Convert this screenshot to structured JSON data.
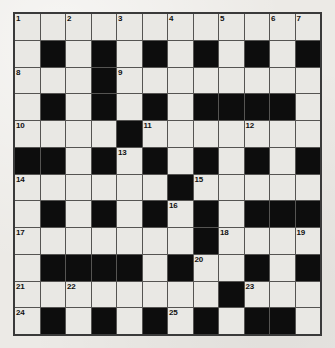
{
  "puzzle": {
    "title": "Crossword Grid",
    "rows": 12,
    "columns": 12,
    "colors": {
      "block": "#0d0d0d",
      "cell": "#e9e8e4",
      "grid_line": "#555452",
      "border": "#3a3a3a",
      "number_text": "#111111",
      "page_background": "#eceae6"
    },
    "numbers_total": 25,
    "grid": [
      [
        "open",
        "open",
        "open",
        "open",
        "open",
        "open",
        "open",
        "open",
        "open",
        "open",
        "open",
        "open"
      ],
      [
        "open",
        "block",
        "open",
        "block",
        "open",
        "block",
        "open",
        "block",
        "open",
        "block",
        "open",
        "block"
      ],
      [
        "open",
        "open",
        "open",
        "block",
        "open",
        "open",
        "open",
        "open",
        "open",
        "open",
        "open",
        "open"
      ],
      [
        "open",
        "block",
        "open",
        "block",
        "open",
        "block",
        "open",
        "block",
        "block",
        "block",
        "block",
        "open"
      ],
      [
        "open",
        "open",
        "open",
        "open",
        "block",
        "open",
        "open",
        "open",
        "open",
        "open",
        "open",
        "open"
      ],
      [
        "block",
        "block",
        "open",
        "block",
        "open",
        "block",
        "open",
        "block",
        "open",
        "block",
        "open",
        "block"
      ],
      [
        "open",
        "open",
        "open",
        "open",
        "open",
        "open",
        "block",
        "open",
        "open",
        "open",
        "open",
        "open"
      ],
      [
        "open",
        "block",
        "open",
        "block",
        "open",
        "block",
        "open",
        "block",
        "open",
        "block",
        "block",
        "block"
      ],
      [
        "open",
        "open",
        "open",
        "open",
        "open",
        "open",
        "open",
        "block",
        "open",
        "open",
        "open",
        "open"
      ],
      [
        "open",
        "block",
        "block",
        "block",
        "block",
        "open",
        "block",
        "open",
        "open",
        "block",
        "open",
        "block"
      ],
      [
        "open",
        "open",
        "open",
        "open",
        "open",
        "open",
        "open",
        "open",
        "block",
        "open",
        "open",
        "open"
      ],
      [
        "open",
        "block",
        "open",
        "block",
        "open",
        "block",
        "open",
        "block",
        "open",
        "block",
        "block",
        "open"
      ],
      [
        "open",
        "open",
        "open",
        "open",
        "open",
        "block",
        "open",
        "open",
        "open",
        "open",
        "open",
        "open"
      ]
    ],
    "numbered_cells": [
      {
        "number": "1",
        "row": 1,
        "col": 1
      },
      {
        "number": "2",
        "row": 1,
        "col": 3
      },
      {
        "number": "3",
        "row": 1,
        "col": 5
      },
      {
        "number": "4",
        "row": 1,
        "col": 7
      },
      {
        "number": "5",
        "row": 1,
        "col": 9
      },
      {
        "number": "6",
        "row": 1,
        "col": 11
      },
      {
        "number": "7",
        "row": 1,
        "col": 12
      },
      {
        "number": "8",
        "row": 3,
        "col": 1
      },
      {
        "number": "9",
        "row": 3,
        "col": 5
      },
      {
        "number": "10",
        "row": 5,
        "col": 1
      },
      {
        "number": "11",
        "row": 5,
        "col": 6
      },
      {
        "number": "12",
        "row": 5,
        "col": 10
      },
      {
        "number": "13",
        "row": 6,
        "col": 5
      },
      {
        "number": "14",
        "row": 7,
        "col": 1
      },
      {
        "number": "15",
        "row": 7,
        "col": 8
      },
      {
        "number": "16",
        "row": 8,
        "col": 7
      },
      {
        "number": "17",
        "row": 9,
        "col": 1
      },
      {
        "number": "18",
        "row": 9,
        "col": 9
      },
      {
        "number": "19",
        "row": 9,
        "col": 12
      },
      {
        "number": "20",
        "row": 10,
        "col": 8
      },
      {
        "number": "21",
        "row": 11,
        "col": 1
      },
      {
        "number": "22",
        "row": 11,
        "col": 3
      },
      {
        "number": "23",
        "row": 11,
        "col": 10
      },
      {
        "number": "24",
        "row": 12,
        "col": 1
      },
      {
        "number": "25",
        "row": 12,
        "col": 7
      }
    ]
  }
}
